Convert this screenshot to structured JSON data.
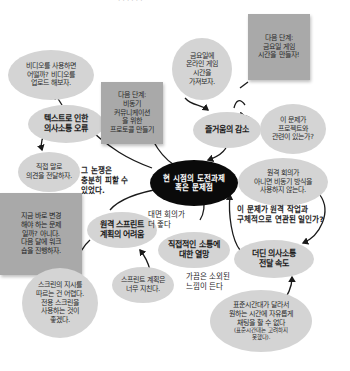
{
  "title_fragment": "· · · · · ·",
  "center": {
    "label": "현 시점의 도전과제\n혹은 문제점"
  },
  "topics": {
    "text_miscommunication": "텍스트로 인한\n의사소통 오류",
    "less_fun": "즐거움의 감소",
    "remote_sprint": "원격 스프린트\n계획의 어려움",
    "want_direct": "직접적인 소통에\n대한 열망",
    "slow_comm": "더딘 의사소통\n전달 속도"
  },
  "thoughts": {
    "use_video": "비디오를 사용하면\n어떨까? 비디오를\n업로드 해보자.",
    "speak_directly": "직접 말로\n의견을 전달하자.",
    "friday_games": "금요일에\n온라인 게임\n시간을\n가져보자.",
    "related_project": "이 문제가\n프로젝트와\n관련이 있는가?",
    "no_async": "원격 회의가\n아니면 비동기 방식을\n사용하지 않는다.",
    "timezone": "표준시간대가 달라서\n원하는 시간에 자유롭게\n채팅을 할 수 없다",
    "timezone_note": "(표준시간대는 고려하지\n못했다).",
    "screen_hard": "스크린의 지시를\n따르는 건 어렵다.\n전용 스크린을\n사용하는 것이\n좋겠다.",
    "sprint_tiring": "스프린트 계획은\n너무 지친다."
  },
  "next_steps": {
    "async_protocol": "다음 단계:\n비동기\n커뮤니케이션\n을 위한\n프로토콜 만들기",
    "game_time": "다음 단계:\n금요일 게임\n시간을 만들자!",
    "workshop": "지금 바로 변경\n해야 하는 문제\n일까? 아니다.\n다음 달에 워크\n숍을 진행하자."
  },
  "annotations": {
    "avoidable": "그 논쟁은\n충분히 피할 수\n있었다.",
    "face_better": "대면 회의가\n더 좋다",
    "remote_question": "이 문제가 원격 작업과\n구체적으로 연관된 일인가?",
    "isolated": "가끔은 소외된\n느낌이 든다"
  },
  "colors": {
    "oval_fill": "#d4d4d4",
    "note_fill": "#a9a9a9",
    "center_fill": "#0a0a0a",
    "line": "#1a1a1a"
  }
}
